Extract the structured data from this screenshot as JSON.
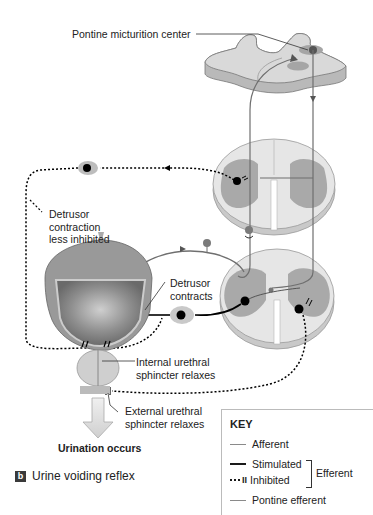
{
  "labels": {
    "pontine_center": "Pontine micturition center",
    "detrusor_less_inhibited": [
      "Detrusor",
      "contraction",
      "less inhibited"
    ],
    "detrusor_contracts": [
      "Detrusor",
      "contracts"
    ],
    "internal_sphincter": [
      "Internal urethral",
      "sphincter relaxes"
    ],
    "external_sphincter": [
      "External urethral",
      "sphincter relaxes"
    ],
    "urination": "Urination occurs"
  },
  "caption": {
    "badge": "b",
    "text": "Urine voiding reflex"
  },
  "key": {
    "title": "KEY",
    "items": [
      {
        "label": "Afferent",
        "style": "solid",
        "color": "#8a8a8a"
      },
      {
        "label": "Stimulated",
        "style": "solid",
        "color": "#1a1a1a"
      },
      {
        "label": "Inhibited",
        "style": "dotted-blocked",
        "color": "#1a1a1a"
      },
      {
        "label": "Pontine efferent",
        "style": "solid",
        "color": "#8a8a8a"
      }
    ],
    "group_label": "Efferent"
  },
  "colors": {
    "tissue_light": "#d9d9d9",
    "gray_matter": "#a9a9a9",
    "tissue_edge": "#bdbdbd",
    "neuron_body": "#000000",
    "afferent_dot": "#7a7a7a",
    "pathway_gray": "#6f6f6f"
  }
}
